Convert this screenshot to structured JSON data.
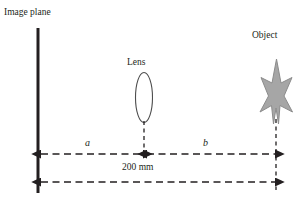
{
  "figure": {
    "type": "optics-ray-diagram",
    "width": 303,
    "height": 202,
    "background": "#ffffff"
  },
  "labels": {
    "image_plane": "Image plane",
    "object": "Object",
    "lens": "Lens",
    "distance_a": "a",
    "distance_b": "b",
    "total_distance": "200 mm"
  },
  "colors": {
    "line": "#231f20",
    "text": "#231f20",
    "star_fill": "#a6a6a6",
    "star_stroke": "#7f7f7f",
    "lens_stroke": "#4d4d4d",
    "dashed": "#231f20"
  },
  "geometry": {
    "image_plane_line": {
      "x": 38,
      "y1": 28,
      "y2": 193,
      "stroke_width": 3
    },
    "lens_ellipse": {
      "cx": 144,
      "cy": 97.5,
      "rx": 8.5,
      "ry": 25
    },
    "lens_axis_dashed": {
      "x": 144,
      "y1": 120,
      "y2": 152
    },
    "object_axis_dashed": {
      "x": 276,
      "y1": 118,
      "y2": 188
    },
    "arrow_a": {
      "y": 154,
      "x1": 42,
      "x2": 143
    },
    "arrow_b": {
      "y": 154,
      "x1": 147,
      "x2": 275
    },
    "arrow_total": {
      "y": 182,
      "x1": 42,
      "x2": 275
    },
    "star": {
      "cx": 276,
      "top": 60,
      "bottom": 125,
      "left": 262,
      "right": 292
    }
  },
  "measurements": {
    "a_label": "a",
    "b_label": "b",
    "total": "200 mm",
    "total_value": 200,
    "total_unit": "mm",
    "relation": "a + b = 200 mm"
  }
}
